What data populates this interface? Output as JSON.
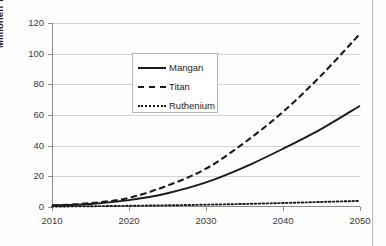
{
  "chart_data": {
    "type": "line",
    "title": "",
    "xlabel": "",
    "ylabel": "Millionen Tonnen",
    "xlim": [
      2010,
      2050
    ],
    "ylim": [
      0,
      120
    ],
    "ytick_step": 20,
    "grid": true,
    "legend_position": "upper-left-inside",
    "x": [
      2010,
      2015,
      2020,
      2025,
      2030,
      2035,
      2040,
      2045,
      2050
    ],
    "xticks": [
      "2010",
      "2020",
      "2030",
      "2040",
      "2050"
    ],
    "yticks": [
      "0",
      "20",
      "40",
      "60",
      "80",
      "100",
      "120"
    ],
    "series": [
      {
        "name": "Mangan",
        "style": "solid",
        "color": "#1a1a1a",
        "values": [
          1,
          2,
          4.5,
          9,
          16,
          26,
          38,
          51,
          66
        ]
      },
      {
        "name": "Titan",
        "style": "dashed",
        "color": "#1a1a1a",
        "values": [
          1,
          2.5,
          6,
          14,
          25,
          42,
          62,
          86,
          113
        ]
      },
      {
        "name": "Ruthenium",
        "style": "dotted",
        "color": "#1a1a1a",
        "values": [
          0.3,
          0.5,
          0.8,
          1.1,
          1.5,
          2.0,
          2.6,
          3.3,
          4.0
        ]
      }
    ]
  },
  "legend": {
    "items": [
      {
        "label": "Mangan"
      },
      {
        "label": "Titan"
      },
      {
        "label": "Ruthenium"
      }
    ]
  },
  "axes": {
    "y_title": "Millionen Tonnen"
  },
  "colors": {
    "series_line": "#1a1a1a",
    "gridline": "#d3d3d3",
    "axis": "#8c8c8c",
    "tick_text": "#3a3a3a",
    "background": "#ffffff"
  }
}
